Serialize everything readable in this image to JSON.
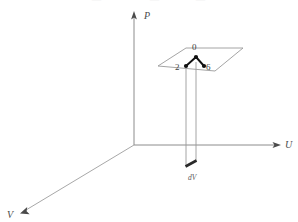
{
  "figure": {
    "title": "",
    "background_color": "#ffffff",
    "axis_color": "#8c8c8c",
    "plane_color": "#9a9a9a",
    "column_color": "#8f8f8f",
    "graph_color": "#111111",
    "label_color": "#4a4a4a",
    "width": 298,
    "height": 222
  },
  "axes": [
    {
      "id": "p",
      "label": "P",
      "label_x": 144,
      "label_y": 17,
      "arrow": "up"
    },
    {
      "id": "u",
      "label": "U",
      "label_x": 286,
      "label_y": 146,
      "arrow": "right"
    },
    {
      "id": "v",
      "label": "V",
      "label_x": 8,
      "label_y": 215,
      "arrow": "down-left"
    }
  ],
  "plane": {
    "name": "horizontal-slice-plane",
    "points": "158,66 186,48 243,48 215,71"
  },
  "graph": {
    "name": "binary-tree-graph",
    "root": {
      "label": "0",
      "x": 196,
      "y": 57,
      "label_x": 193,
      "label_y": 50
    },
    "children": [
      {
        "label": "2",
        "x": 186,
        "y": 66,
        "label_x": 177,
        "label_y": 69
      },
      {
        "label": "6",
        "x": 204,
        "y": 66,
        "label_x": 207,
        "label_y": 69
      }
    ]
  },
  "column": {
    "name": "vertical-prism-column",
    "left_x": 186,
    "right_x": 196,
    "top_y": 67,
    "bottom_y": 166
  },
  "volume_element": {
    "label": "dV",
    "label_x": 192,
    "label_y": 178
  },
  "origin": {
    "x": 134,
    "y": 145
  },
  "top_cut_text": [
    {
      "text": "—",
      "x": 92
    },
    {
      "text": "—",
      "x": 150
    },
    {
      "text": "—",
      "x": 196
    }
  ]
}
